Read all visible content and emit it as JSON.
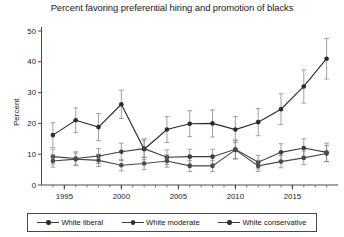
{
  "chart_data": {
    "type": "line",
    "title": "Percent favoring preferential hiring and promotion of blacks",
    "xlabel": "",
    "ylabel": "Percent",
    "ylim": [
      0,
      50
    ],
    "ytick_values": [
      0,
      10,
      20,
      30,
      40,
      50
    ],
    "ytick_labels": [
      "0",
      "10",
      "20",
      "30",
      "40",
      "50"
    ],
    "xlim": [
      1993,
      2019
    ],
    "xtick_values": [
      1995,
      2000,
      2005,
      2010,
      2015
    ],
    "xtick_labels": [
      "1995",
      "2000",
      "2005",
      "2010",
      "2015"
    ],
    "minor_xticks": true,
    "grid": false,
    "legend_position": "bottom",
    "error_bars": "95% confidence interval",
    "series": [
      {
        "name": "White liberal",
        "color": "#2b2b2b",
        "x": [
          1994,
          1996,
          1998,
          2000,
          2002,
          2004,
          2006,
          2008,
          2010,
          2012,
          2014,
          2016,
          2018
        ],
        "values": [
          16.2,
          21.0,
          18.8,
          26.2,
          11.6,
          18.0,
          19.9,
          20.0,
          18.0,
          20.4,
          24.6,
          32.0,
          41.0
        ],
        "err_low": [
          4.0,
          4.0,
          4.4,
          4.6,
          3.4,
          4.2,
          4.2,
          4.4,
          4.2,
          4.4,
          5.0,
          5.4,
          6.6
        ],
        "err_high": [
          4.0,
          4.0,
          4.4,
          4.6,
          3.4,
          4.2,
          4.2,
          4.4,
          4.2,
          4.4,
          5.0,
          5.4,
          6.6
        ]
      },
      {
        "name": "White moderate",
        "color": "#3d3d3d",
        "x": [
          1994,
          1996,
          1998,
          2000,
          2002,
          2004,
          2006,
          2008,
          2010,
          2012,
          2014,
          2016,
          2018
        ],
        "values": [
          9.2,
          8.6,
          9.4,
          10.8,
          11.8,
          9.0,
          9.2,
          9.2,
          11.6,
          7.4,
          10.6,
          12.0,
          10.6
        ],
        "err_low": [
          2.4,
          2.2,
          2.4,
          2.8,
          2.8,
          2.4,
          2.4,
          2.4,
          3.0,
          2.2,
          2.8,
          3.0,
          3.0
        ],
        "err_high": [
          2.4,
          2.2,
          2.4,
          2.8,
          2.8,
          2.4,
          2.4,
          2.4,
          3.0,
          2.2,
          2.8,
          3.0,
          3.0
        ]
      },
      {
        "name": "White conservative",
        "color": "#4a4a4a",
        "x": [
          1994,
          1996,
          1998,
          2000,
          2002,
          2004,
          2006,
          2008,
          2010,
          2012,
          2014,
          2016,
          2018
        ],
        "values": [
          7.8,
          8.4,
          8.0,
          6.4,
          7.0,
          7.8,
          6.2,
          6.2,
          11.4,
          6.2,
          7.6,
          8.8,
          10.2
        ],
        "err_low": [
          2.0,
          2.0,
          2.0,
          1.8,
          2.0,
          2.0,
          1.8,
          1.8,
          3.0,
          1.8,
          2.0,
          2.2,
          2.6
        ],
        "err_high": [
          2.0,
          2.0,
          2.0,
          1.8,
          2.0,
          2.0,
          1.8,
          1.8,
          3.0,
          1.8,
          2.0,
          2.2,
          2.6
        ]
      }
    ]
  },
  "legend": {
    "items": [
      {
        "label": "White liberal"
      },
      {
        "label": "White moderate"
      },
      {
        "label": "White conservative"
      }
    ]
  }
}
